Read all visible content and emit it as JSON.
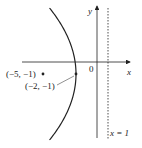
{
  "diagram": {
    "axes": {
      "x_label": "x",
      "y_label": "y",
      "origin_label": "0"
    },
    "curve": {
      "type": "parabola",
      "equation": "(y+1)^2 = -12(x+2)",
      "opens": "left"
    },
    "points": [
      {
        "label": "(−5, −1)",
        "x": -5,
        "y": -1,
        "role": "focus"
      },
      {
        "label": "(−2, −1)",
        "x": -2,
        "y": -1,
        "role": "vertex"
      }
    ],
    "directrix": {
      "label": "x = 1",
      "x": 1,
      "style": "dashed"
    },
    "colors": {
      "line": "#222222",
      "background": "#ffffff"
    }
  }
}
